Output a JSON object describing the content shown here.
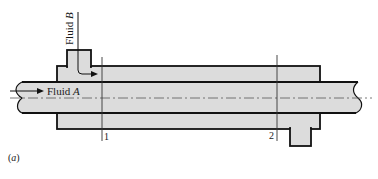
{
  "diagram": {
    "type": "double-pipe heat exchanger",
    "labels": {
      "fluid_a": "Fluid A",
      "fluid_a_prefix": "Fluid ",
      "fluid_a_italic": "A",
      "fluid_b_prefix": "Fluid ",
      "fluid_b_italic": "B",
      "section_1": "1",
      "section_2": "2",
      "caption": "(a)",
      "caption_open": "(",
      "caption_italic": "a",
      "caption_close": ")"
    },
    "colors": {
      "fill": "#dcdcdc",
      "stroke": "#111111",
      "centerline": "#555555",
      "background": "#ffffff"
    }
  }
}
